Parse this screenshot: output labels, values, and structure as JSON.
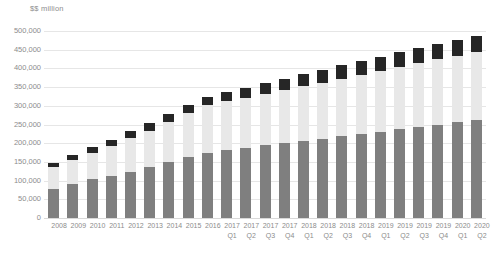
{
  "chart_data": {
    "type": "bar",
    "subtype": "stacked-bar",
    "title": "",
    "subtitle": "",
    "axis_unit_label": "$$ million",
    "xlabel": "",
    "ylabel": "",
    "ylim": [
      0,
      500000
    ],
    "ytick_step": 50000,
    "grid": true,
    "legend": "none",
    "categories": [
      "2008",
      "2009",
      "2010",
      "2011",
      "2012",
      "2013",
      "2014",
      "2015",
      "2016",
      "2017 Q1",
      "2017 Q2",
      "2017 Q3",
      "2017 Q4",
      "2018 Q1",
      "2018 Q2",
      "2018 Q3",
      "2018 Q4",
      "2019 Q1",
      "2019 Q2",
      "2019 Q3",
      "2019 Q4",
      "2020 Q1",
      "2020 Q2"
    ],
    "category_year": [
      "2008",
      "2009",
      "2010",
      "2011",
      "2012",
      "2013",
      "2014",
      "2015",
      "2016",
      "2017",
      "2017",
      "2017",
      "2017",
      "2018",
      "2018",
      "2018",
      "2018",
      "2019",
      "2019",
      "2019",
      "2019",
      "2020",
      "2020"
    ],
    "category_quarter": [
      "",
      "",
      "",
      "",
      "",
      "",
      "",
      "",
      "",
      "Q1",
      "Q2",
      "Q3",
      "Q4",
      "Q1",
      "Q2",
      "Q3",
      "Q4",
      "Q1",
      "Q2",
      "Q3",
      "Q4",
      "Q1",
      "Q2"
    ],
    "ytick_labels": [
      "500,000",
      "450,000",
      "400,000",
      "350,000",
      "300,000",
      "250,000",
      "200,000",
      "150,000",
      "100,000",
      "50,000",
      "0"
    ],
    "ytick_values": [
      500000,
      450000,
      400000,
      350000,
      300000,
      250000,
      200000,
      150000,
      100000,
      50000,
      0
    ],
    "series": [
      {
        "name": "bottom-segment",
        "color": "#7f7f7f",
        "values": [
          78000,
          91000,
          104000,
          113000,
          124000,
          136000,
          150000,
          162000,
          175000,
          182000,
          188000,
          194000,
          200000,
          206000,
          212000,
          218000,
          224000,
          230000,
          238000,
          244000,
          250000,
          256000,
          262000
        ]
      },
      {
        "name": "middle-segment",
        "color": "#e8e8e8",
        "values": [
          59000,
          64000,
          70000,
          80000,
          90000,
          98000,
          108000,
          118000,
          126000,
          130000,
          134000,
          138000,
          142000,
          146000,
          150000,
          154000,
          158000,
          162000,
          166000,
          170000,
          174000,
          178000,
          182000
        ]
      },
      {
        "name": "top-segment",
        "color": "#262626",
        "values": [
          11000,
          13000,
          15000,
          17000,
          18000,
          19000,
          20000,
          21000,
          22000,
          24000,
          26000,
          28000,
          30000,
          32000,
          34000,
          36000,
          37000,
          38000,
          39000,
          40000,
          41000,
          43000,
          44000
        ]
      }
    ],
    "totals": [
      148000,
      168000,
      189000,
      210000,
      232000,
      253000,
      278000,
      301000,
      323000,
      336000,
      348000,
      360000,
      372000,
      384000,
      396000,
      408000,
      419000,
      430000,
      443000,
      454000,
      465000,
      477000,
      488000
    ],
    "colors": {
      "bottom": "#7f7f7f",
      "middle": "#e8e8e8",
      "top": "#262626",
      "gridline": "#e6e6e6",
      "text": "#8c8c8c",
      "background": "#ffffff"
    }
  }
}
